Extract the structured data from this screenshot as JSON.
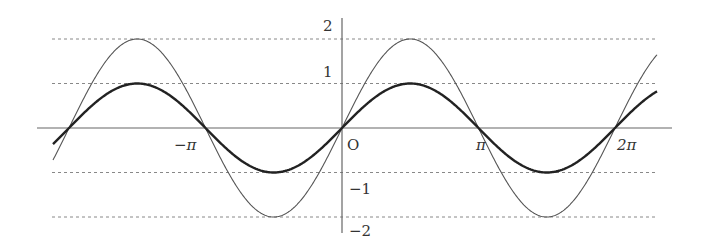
{
  "chart_data": {
    "type": "line",
    "title": "",
    "xlabel": "",
    "ylabel": "",
    "origin_label": "O",
    "x_ticks": [
      {
        "value": -3.14159,
        "label": "−π"
      },
      {
        "value": 3.14159,
        "label": "π"
      },
      {
        "value": 6.28318,
        "label": "2π"
      }
    ],
    "y_ticks": [
      {
        "value": 2,
        "label": "2"
      },
      {
        "value": 1,
        "label": "1"
      },
      {
        "value": -1,
        "label": "−1"
      },
      {
        "value": -2,
        "label": "−2"
      }
    ],
    "xlim": [
      -6.7,
      7.4
    ],
    "ylim": [
      -2.35,
      2.5
    ],
    "grid": "dashed horizontal lines at y = 2, 1, -1, -2",
    "series": [
      {
        "name": "y = 2 sin x",
        "function": "2*sin(x)",
        "amplitude": 2,
        "stroke": "thin",
        "color": "#555555",
        "x_range": [
          -6.68,
          7.32
        ]
      },
      {
        "name": "y = sin x",
        "function": "sin(x)",
        "amplitude": 1,
        "stroke": "thick",
        "color": "#222222",
        "x_range": [
          -6.68,
          7.32
        ]
      }
    ],
    "sample_points": {
      "x": [
        -6.28,
        -4.71,
        -3.14,
        -1.57,
        0,
        1.57,
        3.14,
        4.71,
        6.28
      ],
      "y_2sinx": [
        0,
        2,
        0,
        -2,
        0,
        2,
        0,
        -2,
        0
      ],
      "y_sinx": [
        0,
        1,
        0,
        -1,
        0,
        1,
        0,
        -1,
        0
      ]
    }
  },
  "layout": {
    "origin_px": [
      342,
      128
    ],
    "px_per_pi": 136.5,
    "px_per_unit_y": 44.5,
    "x_axis_px": [
      37,
      672
    ],
    "y_axis_px": [
      18,
      233
    ],
    "grid_px": [
      52,
      658
    ],
    "curve_x_px": [
      53,
      657
    ]
  },
  "colors": {
    "axis": "#666666",
    "grid": "#888888",
    "thin_curve": "#555555",
    "thick_curve": "#222222"
  }
}
